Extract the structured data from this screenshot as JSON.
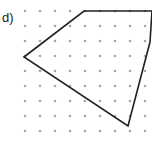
{
  "figure": {
    "part_label": "d)",
    "canvas": {
      "width": 152,
      "height": 144,
      "background": "#ffffff"
    },
    "stroke_color": "#231f20",
    "stroke_width": 1.6,
    "dot_color": "#a6a6a6",
    "dot_radius": 1.3
  },
  "chart_data": {
    "type": "scatter",
    "title": "",
    "subtitle": "",
    "xlabel": "",
    "ylabel": "",
    "grid": true,
    "legend": null,
    "annotations": [
      "d)"
    ],
    "axis_visible": false,
    "tick_labels": {
      "x": [],
      "y": []
    },
    "xlim": [
      0,
      152
    ],
    "ylim": [
      144,
      0
    ],
    "lattice": {
      "name": "dot-grid",
      "origin_x": 25,
      "origin_y": 11,
      "spacing_x": 15,
      "spacing_y": 15,
      "cols": 9,
      "rows": 9,
      "x_values": [
        25,
        40,
        55,
        70,
        85,
        100,
        115,
        130,
        145
      ],
      "y_values": [
        11,
        26,
        41,
        56,
        71,
        86,
        101,
        116,
        131
      ]
    },
    "series": [
      {
        "name": "polygon",
        "closed": true,
        "fill": "none",
        "points": [
          [
            24,
            57
          ],
          [
            84,
            11
          ],
          [
            152,
            11
          ],
          [
            150,
            42
          ],
          [
            128,
            126
          ]
        ],
        "vertex_labels": [
          "left",
          "top-left",
          "top-right-clipped",
          "right",
          "bottom"
        ]
      }
    ]
  }
}
